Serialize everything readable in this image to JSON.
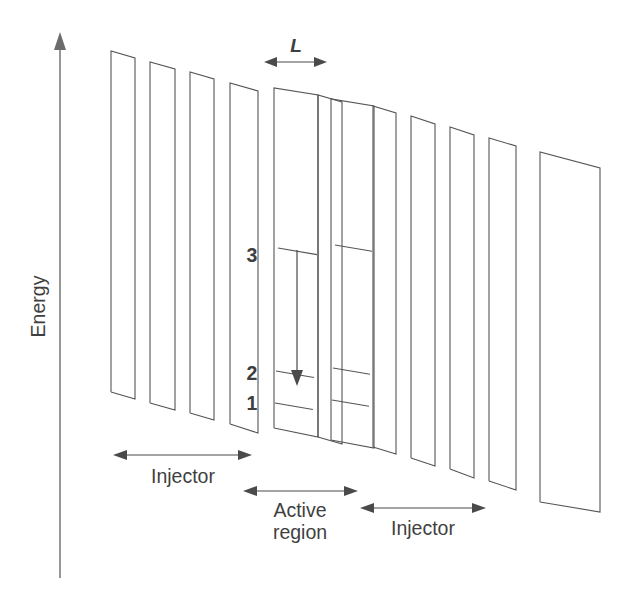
{
  "figure": {
    "type": "quantum-cascade-laser-band-diagram",
    "background_color": "#ffffff",
    "line_color": "#555555",
    "text_color": "#3f3f3f"
  },
  "axis": {
    "label": "Energy",
    "orientation": "vertical",
    "arrow_direction": "up",
    "x": 60,
    "y_top": 35,
    "y_bottom": 578
  },
  "labels": {
    "period_length": "L",
    "level_3": "3",
    "level_2": "2",
    "level_1": "1",
    "injector_left": "Injector",
    "active_region_line1": "Active",
    "active_region_line2": "region",
    "injector_right": "Injector"
  },
  "chart_data": {
    "type": "line",
    "title": "",
    "xlabel": "",
    "ylabel": "Energy",
    "grid": false,
    "legend": null,
    "energy_levels": [
      {
        "name": "3",
        "label_x": 252,
        "label_y": 262,
        "well_a": [
          278,
          317,
          248
        ],
        "well_b": [
          335,
          372,
          245
        ]
      },
      {
        "name": "2",
        "label_x": 252,
        "label_y": 380,
        "well_a": [
          276,
          314,
          371
        ],
        "well_b": [
          333,
          370,
          368
        ]
      },
      {
        "name": "1",
        "label_x": 252,
        "label_y": 410,
        "well_a": [
          275,
          313,
          403
        ],
        "well_b": [
          332,
          369,
          400
        ]
      }
    ],
    "radiative_transition": {
      "from_level": "3",
      "to_level": "2",
      "x": 297,
      "y_start": 250,
      "y_end": 384
    },
    "period_marker": {
      "label": "L",
      "x_start": 266,
      "x_end": 325,
      "y": 62,
      "label_x": 296,
      "label_y": 52
    },
    "region_markers": [
      {
        "label": "Injector",
        "x_start": 115,
        "x_end": 250,
        "arrow_y": 455,
        "text_x": 183,
        "text_y": 483
      },
      {
        "label": "Active region",
        "x_start": 245,
        "x_end": 356,
        "arrow_y": 491,
        "text_x": 300,
        "text_y": 517
      },
      {
        "label": "Injector",
        "x_start": 362,
        "x_end": 484,
        "arrow_y": 508,
        "text_x": 423,
        "text_y": 535
      }
    ],
    "barriers": [
      {
        "index": 0,
        "x_left": 111,
        "x_right": 135,
        "y_top_left": 51,
        "y_top_right": 58,
        "y_bot_left": 392,
        "y_bot_right": 399
      },
      {
        "index": 1,
        "x_left": 150,
        "x_right": 175,
        "y_top_left": 62,
        "y_top_right": 69,
        "y_bot_left": 403,
        "y_bot_right": 410
      },
      {
        "index": 2,
        "x_left": 190,
        "x_right": 214,
        "y_top_left": 72,
        "y_top_right": 79,
        "y_bot_left": 413,
        "y_bot_right": 420
      },
      {
        "index": 3,
        "x_left": 230,
        "x_right": 258,
        "y_top_left": 83,
        "y_top_right": 91,
        "y_bot_left": 424,
        "y_bot_right": 433
      },
      {
        "index": 4,
        "x_left": 318,
        "x_right": 342,
        "y_top_left": 95,
        "y_top_right": 102,
        "y_bot_left": 437,
        "y_bot_right": 444
      },
      {
        "index": 5,
        "x_left": 373,
        "x_right": 396,
        "y_top_left": 106,
        "y_top_right": 113,
        "y_bot_left": 447,
        "y_bot_right": 454
      },
      {
        "index": 6,
        "x_left": 411,
        "x_right": 435,
        "y_top_left": 116,
        "y_top_right": 124,
        "y_bot_left": 458,
        "y_bot_right": 466
      },
      {
        "index": 7,
        "x_left": 450,
        "x_right": 474,
        "y_top_left": 127,
        "y_top_right": 135,
        "y_bot_left": 469,
        "y_bot_right": 478
      },
      {
        "index": 8,
        "x_left": 489,
        "x_right": 516,
        "y_top_left": 138,
        "y_top_right": 146,
        "y_bot_left": 481,
        "y_bot_right": 490
      },
      {
        "index": 9,
        "x_left": 540,
        "x_right": 600,
        "y_top_left": 152,
        "y_top_right": 168,
        "y_bot_left": 502,
        "y_bot_right": 512
      }
    ],
    "active_wells": [
      {
        "index": 0,
        "x_left": 274,
        "x_right": 318,
        "y_top_left": 88,
        "y_top_right": 95,
        "y_bot_left": 428,
        "y_bot_right": 437
      },
      {
        "index": 1,
        "x_left": 331,
        "x_right": 374,
        "y_top_left": 99,
        "y_top_right": 106,
        "y_bot_left": 440,
        "y_bot_right": 448
      }
    ]
  }
}
